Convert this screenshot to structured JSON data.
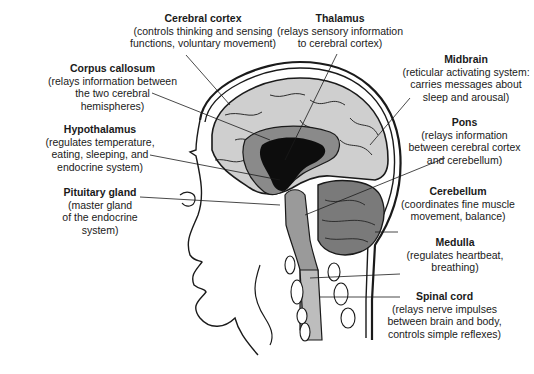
{
  "diagram": {
    "labels": [
      {
        "id": "cerebral-cortex",
        "title": "Cerebral cortex",
        "desc": [
          "(controls thinking and sensing",
          "functions, voluntary movement)"
        ]
      },
      {
        "id": "thalamus",
        "title": "Thalamus",
        "desc": [
          "(relays sensory information",
          "to cerebral cortex)"
        ]
      },
      {
        "id": "corpus-callosum",
        "title": "Corpus callosum",
        "desc": [
          "(relays information between",
          "the two cerebral",
          "hemispheres)"
        ]
      },
      {
        "id": "midbrain",
        "title": "Midbrain",
        "desc": [
          "(reticular activating system:",
          "carries messages about",
          "sleep and arousal)"
        ]
      },
      {
        "id": "hypothalamus",
        "title": "Hypothalamus",
        "desc": [
          "(regulates temperature,",
          "eating, sleeping, and",
          "endocrine system)"
        ]
      },
      {
        "id": "pons",
        "title": "Pons",
        "desc": [
          "(relays information",
          "between cerebral cortex",
          "and cerebellum)"
        ]
      },
      {
        "id": "pituitary-gland",
        "title": "Pituitary gland",
        "desc": [
          "(master gland",
          "of the endocrine",
          "system)"
        ]
      },
      {
        "id": "cerebellum",
        "title": "Cerebellum",
        "desc": [
          "(coordinates fine muscle",
          "movement, balance)"
        ]
      },
      {
        "id": "medulla",
        "title": "Medulla",
        "desc": [
          "(regulates heartbeat,",
          "breathing)"
        ]
      },
      {
        "id": "spinal-cord",
        "title": "Spinal cord",
        "desc": [
          "(relays nerve impulses",
          "between brain and body,",
          "controls simple reflexes)"
        ]
      }
    ],
    "colors": {
      "line": "#1a1a1a",
      "cortex_fill": "#cfcfcf",
      "inner_gray": "#8a8a8a",
      "ventricle": "#0d0d0d",
      "cerebellum": "#7a7a7a",
      "background": "#ffffff"
    }
  }
}
